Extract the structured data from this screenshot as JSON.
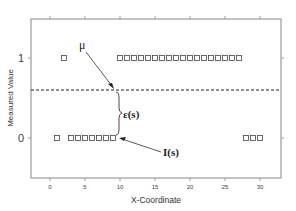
{
  "chart_data": {
    "type": "scatter",
    "title": "",
    "xlabel": "X-Coordinate",
    "ylabel": "Measured Value",
    "xlim": [
      -3,
      33
    ],
    "ylim": [
      -0.5,
      1.5
    ],
    "xticks": [
      0,
      5,
      10,
      15,
      20,
      25,
      30
    ],
    "yticks": [
      0,
      1
    ],
    "grid": false,
    "marker": "open-square",
    "series": [
      {
        "name": "Measured values I(s)",
        "points": [
          [
            1,
            0
          ],
          [
            2,
            1
          ],
          [
            3,
            0
          ],
          [
            4,
            0
          ],
          [
            5,
            0
          ],
          [
            6,
            0
          ],
          [
            7,
            0
          ],
          [
            8,
            0
          ],
          [
            9,
            0
          ],
          [
            10,
            1
          ],
          [
            11,
            1
          ],
          [
            12,
            1
          ],
          [
            13,
            1
          ],
          [
            14,
            1
          ],
          [
            15,
            1
          ],
          [
            16,
            1
          ],
          [
            17,
            1
          ],
          [
            18,
            1
          ],
          [
            19,
            1
          ],
          [
            20,
            1
          ],
          [
            21,
            1
          ],
          [
            22,
            1
          ],
          [
            23,
            1
          ],
          [
            24,
            1
          ],
          [
            25,
            1
          ],
          [
            26,
            1
          ],
          [
            27,
            1
          ],
          [
            28,
            0
          ],
          [
            29,
            0
          ],
          [
            30,
            0
          ]
        ]
      }
    ],
    "reference_line": {
      "name": "mean",
      "label": "μ",
      "y": 0.6,
      "style": "dashed"
    },
    "annotations": [
      {
        "label": "μ",
        "target": "mean line",
        "type": "arrow"
      },
      {
        "label": "ε(s)",
        "type": "brace",
        "between": "I(s) at x=9 and μ"
      },
      {
        "label": "I(s)",
        "target": "point (9, 0)",
        "type": "arrow"
      }
    ]
  },
  "axes": {
    "xlabel": "X-Coordinate",
    "ylabel": "Measured Value",
    "xtick_labels": [
      "0",
      "5",
      "10",
      "15",
      "20",
      "25",
      "30"
    ],
    "ytick_labels": [
      "0",
      "1"
    ]
  },
  "annotations": {
    "mu": "μ",
    "epsilon": "ε(s)",
    "I": "I(s)"
  }
}
